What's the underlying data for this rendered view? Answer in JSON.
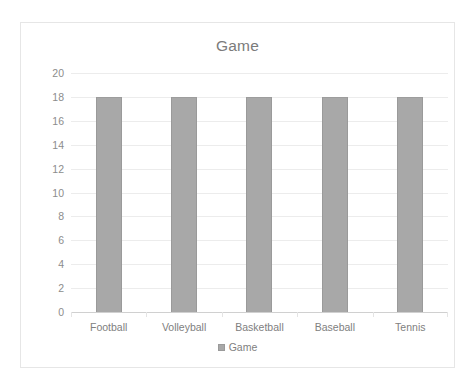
{
  "chart_data": {
    "type": "bar",
    "title": "Game",
    "xlabel": "",
    "ylabel": "",
    "categories": [
      "Football",
      "Volleyball",
      "Basketball",
      "Baseball",
      "Tennis"
    ],
    "series": [
      {
        "name": "Game",
        "values": [
          18,
          18,
          18,
          18,
          18
        ]
      }
    ],
    "ylim": [
      0,
      20
    ],
    "ytick_step": 2,
    "yticks": [
      20,
      18,
      16,
      14,
      12,
      10,
      8,
      6,
      4,
      2,
      0
    ],
    "grid": true,
    "legend": {
      "position": "bottom",
      "entries": [
        "Game"
      ]
    },
    "colors": {
      "bar_fill": "#a8a8a8",
      "bar_border": "#9a9a9a",
      "gridline": "#ececec",
      "axis_line": "#d0d0d0",
      "title_text": "#7b7b7b",
      "tick_text": "#808080",
      "frame_border": "#e6e6e6",
      "background": "#ffffff"
    }
  }
}
